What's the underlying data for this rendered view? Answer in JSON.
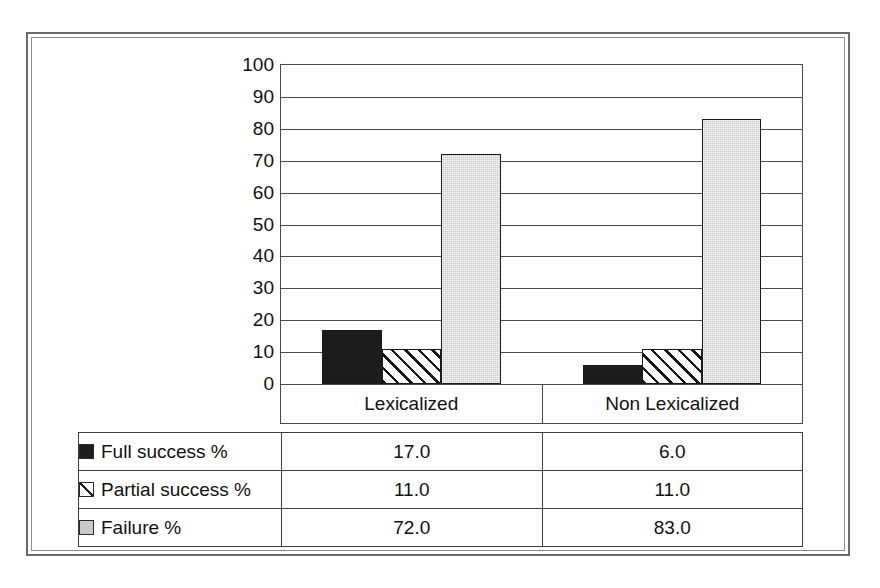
{
  "chart_data": {
    "type": "bar",
    "title": "",
    "subtitle": "",
    "xlabel": "",
    "ylabel": "",
    "ylim": [
      0,
      100
    ],
    "y_ticks": [
      100,
      90,
      80,
      70,
      60,
      50,
      40,
      30,
      20,
      10,
      0
    ],
    "grid": true,
    "legend_position": "data-table-below",
    "categories": [
      "Lexicalized",
      "Non Lexicalized"
    ],
    "series": [
      {
        "name": "Full success %",
        "values": [
          17.0,
          11.0
        ],
        "swatch": "black-filled-square",
        "color": "#1c1c1c"
      },
      {
        "name": "Partial success %",
        "values": [
          11.0,
          11.0
        ],
        "swatch": "diagonal-hatched-square",
        "color": "#ffffff"
      },
      {
        "name": "Failure %",
        "values": [
          72.0,
          83.0
        ],
        "swatch": "gray-filled-square",
        "color": "#c9c9c9"
      }
    ],
    "series_values_by_category": {
      "Lexicalized": {
        "Full success %": 17.0,
        "Partial success %": 11.0,
        "Failure %": 72.0
      },
      "Non Lexicalized": {
        "Full success %": 6.0,
        "Partial success %": 11.0,
        "Failure %": 83.0
      }
    },
    "bar_values": [
      [
        17.0,
        11.0,
        72.0
      ],
      [
        6.0,
        11.0,
        83.0
      ]
    ]
  },
  "axis": {
    "y_ticks": [
      "100",
      "90",
      "80",
      "70",
      "60",
      "50",
      "40",
      "30",
      "20",
      "10",
      "0"
    ]
  },
  "categories": [
    {
      "label": "Lexicalized"
    },
    {
      "label": "Non Lexicalized"
    }
  ],
  "table": {
    "rows": [
      {
        "legend_label": "Full success %",
        "swatch": "black-filled-square",
        "values": [
          "17.0",
          "6.0"
        ]
      },
      {
        "legend_label": "Partial success %",
        "swatch": "diagonal-hatched-square",
        "values": [
          "11.0",
          "11.0"
        ]
      },
      {
        "legend_label": "Failure %",
        "swatch": "gray-filled-square",
        "values": [
          "72.0",
          "83.0"
        ]
      }
    ]
  },
  "colors": {
    "full_success": "#1c1c1c",
    "partial_success": "#ffffff",
    "failure": "#c9c9c9",
    "axis": "#4a4a4a",
    "frame": "#6b6b6b"
  }
}
